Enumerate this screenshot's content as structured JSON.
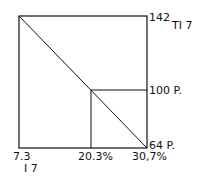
{
  "diagram": {
    "labels": {
      "top_right_value": "142",
      "top_right_tag": "TI 7",
      "mid_right_value": "100 P.",
      "bottom_right_value": "64 P.",
      "bottom_left_value": "7.3",
      "bottom_left_tag": "I 7",
      "bottom_mid_value": "20.3%",
      "bottom_right_axis_value": "30,7%"
    },
    "line_color": "#111111"
  }
}
